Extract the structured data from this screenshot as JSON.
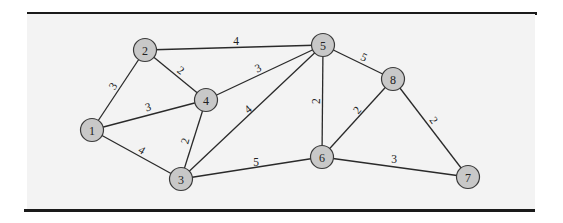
{
  "figure": {
    "type": "weighted-undirected-graph",
    "colors": {
      "panel_background": "#f3f3f3",
      "node_fill": "#c8c8c8",
      "node_stroke": "#3a3a3a",
      "edge": "#2a2a2a",
      "rule": "#1a1a1a"
    }
  },
  "nodes": [
    {
      "id": "1",
      "label": "1",
      "x": 92,
      "y": 130
    },
    {
      "id": "2",
      "label": "2",
      "x": 145,
      "y": 50
    },
    {
      "id": "3",
      "label": "3",
      "x": 181,
      "y": 179
    },
    {
      "id": "4",
      "label": "4",
      "x": 206,
      "y": 100
    },
    {
      "id": "5",
      "label": "5",
      "x": 323,
      "y": 45
    },
    {
      "id": "6",
      "label": "6",
      "x": 322,
      "y": 157
    },
    {
      "id": "7",
      "label": "7",
      "x": 468,
      "y": 177
    },
    {
      "id": "8",
      "label": "8",
      "x": 393,
      "y": 79
    }
  ],
  "edges": [
    {
      "from": "1",
      "to": "2",
      "weight": "3",
      "lx": 113,
      "ly": 86,
      "rot": -58
    },
    {
      "from": "1",
      "to": "4",
      "weight": "3",
      "lx": 148,
      "ly": 107,
      "rot": -15
    },
    {
      "from": "1",
      "to": "3",
      "weight": "4",
      "lx": 142,
      "ly": 150,
      "rot": 30
    },
    {
      "from": "2",
      "to": "4",
      "weight": "2",
      "lx": 181,
      "ly": 70,
      "rot": 35
    },
    {
      "from": "2",
      "to": "5",
      "weight": "4",
      "lx": 236,
      "ly": 41,
      "rot": 0
    },
    {
      "from": "4",
      "to": "5",
      "weight": "3",
      "lx": 258,
      "ly": 68,
      "rot": -25
    },
    {
      "from": "4",
      "to": "3",
      "weight": "2",
      "lx": 185,
      "ly": 141,
      "rot": -75
    },
    {
      "from": "3",
      "to": "5",
      "weight": "4",
      "lx": 248,
      "ly": 109,
      "rot": -40
    },
    {
      "from": "3",
      "to": "6",
      "weight": "5",
      "lx": 256,
      "ly": 162,
      "rot": 0
    },
    {
      "from": "5",
      "to": "6",
      "weight": "2",
      "lx": 316,
      "ly": 101,
      "rot": -90
    },
    {
      "from": "5",
      "to": "8",
      "weight": "5",
      "lx": 364,
      "ly": 57,
      "rot": 25
    },
    {
      "from": "8",
      "to": "6",
      "weight": "2",
      "lx": 357,
      "ly": 110,
      "rot": -50
    },
    {
      "from": "8",
      "to": "7",
      "weight": "2",
      "lx": 434,
      "ly": 120,
      "rot": 55
    },
    {
      "from": "6",
      "to": "7",
      "weight": "3",
      "lx": 394,
      "ly": 159,
      "rot": 0
    }
  ]
}
